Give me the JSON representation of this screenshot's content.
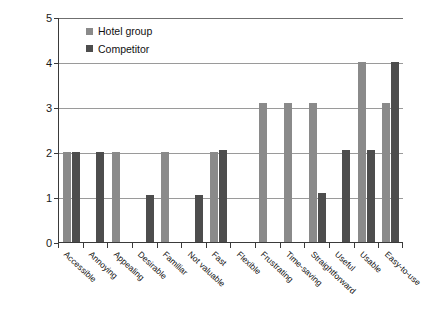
{
  "chart_data": {
    "type": "bar",
    "title": "",
    "xlabel": "",
    "ylabel": "",
    "ylim": [
      0,
      5
    ],
    "yticks": [
      0,
      1,
      2,
      3,
      4,
      5
    ],
    "grid": true,
    "legend_position": "top-left",
    "categories": [
      "Accessible",
      "Annoying",
      "Appealing",
      "Desirable",
      "Familiar",
      "Not valuable",
      "Fast",
      "Flexible",
      "Frustrating",
      "Time-saving",
      "Straightforward",
      "Useful",
      "Usable",
      "Easy-to-use"
    ],
    "series": [
      {
        "name": "Hotel group",
        "color": "#8a8a8a",
        "values": [
          2,
          0,
          2,
          0,
          2,
          0,
          2,
          0,
          3.1,
          3.1,
          3.1,
          0,
          4,
          3.1
        ]
      },
      {
        "name": "Competitor",
        "color": "#4d4d4d",
        "values": [
          2,
          2,
          0,
          1.05,
          0,
          1.05,
          2.05,
          0,
          0,
          0,
          1.1,
          2.05,
          2.05,
          4
        ]
      }
    ]
  },
  "legend": {
    "items": [
      {
        "label": "Hotel group",
        "swatch": "light"
      },
      {
        "label": "Competitor",
        "swatch": "dark"
      }
    ]
  },
  "axis": {
    "y_labels": [
      "5",
      "4",
      "3",
      "2",
      "1",
      "0"
    ]
  }
}
